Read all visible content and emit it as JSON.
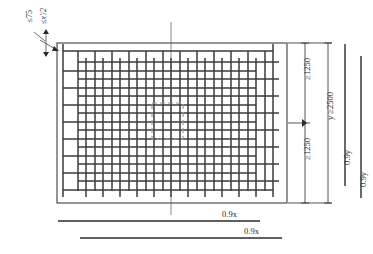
{
  "figure": {
    "type": "engineering-detail-drawing",
    "units": "mm"
  },
  "slab": {
    "outline_name": "slab-outline-rectangle",
    "x_left": 57,
    "x_right": 287,
    "y_top": 43,
    "y_bottom": 203
  },
  "mesh": {
    "layer_a_name": "lower-mesh-layer",
    "layer_b_name": "upper-mesh-layer",
    "vertical_bars": 16,
    "horizontal_bars": 11
  },
  "column": {
    "name": "column-footprint-dashed",
    "style": "dashed"
  },
  "centerline": {
    "name": "vertical-centre-line",
    "style": "thin-continuous"
  },
  "labels": {
    "cover_top": "≤75",
    "spacing_top": "≤x'/2",
    "dim_upper": "≥1250",
    "dim_lower": "≥1250",
    "dim_total": "y ≥2500",
    "dim_bar_y_1": "0.9y",
    "dim_bar_y_2": "0.9y",
    "dim_bar_x_1": "0.9x",
    "dim_bar_x_2": "0.9x"
  },
  "colors": {
    "ink": "#2a2a2a",
    "bar": "#3a3a3a",
    "thin": "#555555",
    "dashed": "#9a9a9a",
    "paper": "#ffffff"
  }
}
